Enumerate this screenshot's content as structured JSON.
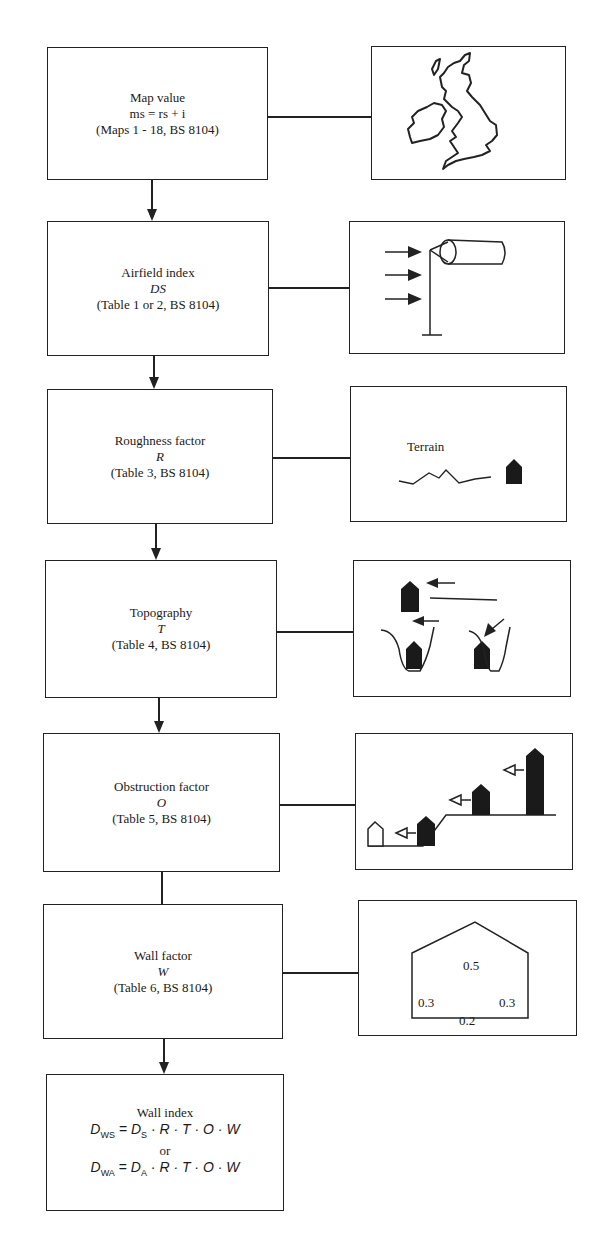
{
  "diagram": {
    "type": "flowchart",
    "steps": [
      {
        "id": "map-value",
        "title": "Map value",
        "formula": "ms = rs + i",
        "reference": "(Maps 1 - 18, BS 8104)",
        "illustration": "uk-map-icon"
      },
      {
        "id": "airfield-index",
        "title": "Airfield index",
        "symbol": "DS",
        "reference": "(Table 1 or 2, BS 8104)",
        "illustration": "windsock-icon"
      },
      {
        "id": "roughness-factor",
        "title": "Roughness factor",
        "symbol": "R",
        "reference": "(Table 3, BS 8104)",
        "illustration": "terrain-icon",
        "illustration_label": "Terrain"
      },
      {
        "id": "topography",
        "title": "Topography",
        "symbol": "T",
        "reference": "(Table 4, BS 8104)",
        "illustration": "topography-icon"
      },
      {
        "id": "obstruction-factor",
        "title": "Obstruction factor",
        "symbol": "O",
        "reference": "(Table 5, BS 8104)",
        "illustration": "obstruction-icon"
      },
      {
        "id": "wall-factor",
        "title": "Wall factor",
        "symbol": "W",
        "reference": "(Table 6, BS 8104)",
        "illustration": "wall-factor-house-icon",
        "wall_values": {
          "roof": "0.5",
          "left": "0.3",
          "right": "0.3",
          "bottom": "0.2"
        }
      }
    ],
    "result": {
      "title": "Wall index",
      "formula1": {
        "lhs": "D",
        "lhs_sub": "WS",
        "rhs_d": "D",
        "rhs_sub": "S",
        "rest": "R · T · O · W"
      },
      "or": "or",
      "formula2": {
        "lhs": "D",
        "lhs_sub": "WA",
        "rhs_d": "D",
        "rhs_sub": "A",
        "rest": "R · T · O · W"
      }
    }
  }
}
